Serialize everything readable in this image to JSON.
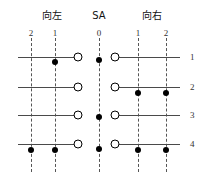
{
  "diagram": {
    "title_groups": [
      {
        "label": "向左",
        "x": 52,
        "y": 10
      },
      {
        "label": "SA",
        "x": 99,
        "y": 10
      },
      {
        "label": "向右",
        "x": 152,
        "y": 10
      }
    ],
    "column_numbers": [
      {
        "label": "2",
        "x": 31,
        "y": 28
      },
      {
        "label": "1",
        "x": 55,
        "y": 28
      },
      {
        "label": "0",
        "x": 99,
        "y": 28
      },
      {
        "label": "1",
        "x": 138,
        "y": 28
      },
      {
        "label": "2",
        "x": 166,
        "y": 28
      }
    ],
    "row_numbers": [
      {
        "label": "1",
        "x": 190,
        "y": 57
      },
      {
        "label": "2",
        "x": 190,
        "y": 87
      },
      {
        "label": "3",
        "x": 190,
        "y": 115
      },
      {
        "label": "4",
        "x": 190,
        "y": 144
      }
    ],
    "guides": [
      {
        "name": "guide-left-2",
        "x": 31,
        "y": 38,
        "height": 134
      },
      {
        "name": "guide-left-1",
        "x": 55,
        "y": 38,
        "height": 134
      },
      {
        "name": "guide-sa-0",
        "x": 99,
        "y": 38,
        "height": 134
      },
      {
        "name": "guide-right-1",
        "x": 138,
        "y": 38,
        "height": 134
      },
      {
        "name": "guide-right-2",
        "x": 166,
        "y": 38,
        "height": 134
      }
    ],
    "bars": [
      {
        "name": "bar-left-row1",
        "x": 18,
        "y": 57,
        "width": 59
      },
      {
        "name": "bar-right-row1",
        "x": 116,
        "y": 57,
        "width": 64
      },
      {
        "name": "bar-left-row2",
        "x": 18,
        "y": 87,
        "width": 59
      },
      {
        "name": "bar-right-row2",
        "x": 116,
        "y": 87,
        "width": 64
      },
      {
        "name": "bar-left-row3",
        "x": 18,
        "y": 115,
        "width": 59
      },
      {
        "name": "bar-right-row3",
        "x": 116,
        "y": 115,
        "width": 64
      },
      {
        "name": "bar-left-row4",
        "x": 18,
        "y": 144,
        "width": 59
      },
      {
        "name": "bar-right-row4",
        "x": 116,
        "y": 144,
        "width": 64
      }
    ],
    "open_circles": [
      {
        "name": "terminal-left-row1",
        "x": 78,
        "y": 57
      },
      {
        "name": "terminal-right-row1",
        "x": 115,
        "y": 57
      },
      {
        "name": "terminal-left-row2",
        "x": 78,
        "y": 87
      },
      {
        "name": "terminal-right-row2",
        "x": 115,
        "y": 87
      },
      {
        "name": "terminal-left-row3",
        "x": 78,
        "y": 115
      },
      {
        "name": "terminal-right-row3",
        "x": 115,
        "y": 115
      },
      {
        "name": "terminal-left-row4",
        "x": 78,
        "y": 144
      },
      {
        "name": "terminal-right-row4",
        "x": 115,
        "y": 144
      }
    ],
    "filled_dots": [
      {
        "name": "contact-left1-row1",
        "x": 55,
        "y": 62
      },
      {
        "name": "contact-sa-row1",
        "x": 99,
        "y": 60
      },
      {
        "name": "contact-right1-row2",
        "x": 138,
        "y": 93
      },
      {
        "name": "contact-right2-row2",
        "x": 166,
        "y": 93
      },
      {
        "name": "contact-sa-row3",
        "x": 99,
        "y": 117
      },
      {
        "name": "contact-left2-row4",
        "x": 31,
        "y": 150
      },
      {
        "name": "contact-left1-row4",
        "x": 55,
        "y": 150
      },
      {
        "name": "contact-sa-row4",
        "x": 99,
        "y": 149
      },
      {
        "name": "contact-right1-row4",
        "x": 138,
        "y": 150
      },
      {
        "name": "contact-right2-row4",
        "x": 166,
        "y": 150
      }
    ]
  }
}
